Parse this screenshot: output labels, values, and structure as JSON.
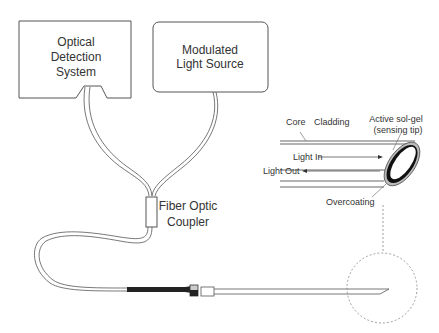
{
  "diagram": {
    "boxes": {
      "detection": {
        "line1": "Optical",
        "line2": "Detection",
        "line3": "System"
      },
      "light_source": {
        "line1": "Modulated",
        "line2": "Light Source"
      }
    },
    "coupler": {
      "line1": "Fiber Optic",
      "line2": "Coupler"
    },
    "fiber_detail": {
      "core": "Core",
      "cladding": "Cladding",
      "sol_gel_line1": "Active sol-gel",
      "sol_gel_line2": "(sensing tip)",
      "light_in": "Light In",
      "light_out": "Light Out",
      "overcoating": "Overcoating"
    },
    "colors": {
      "stroke": "#555555",
      "text": "#333333",
      "fill": "#ffffff",
      "sheath": "#222222"
    }
  }
}
